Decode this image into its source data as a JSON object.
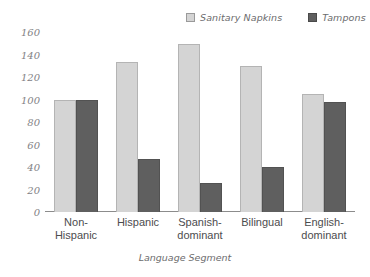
{
  "chart_data": {
    "type": "bar",
    "title": "",
    "subtitle": "",
    "xlabel": "Language Segment",
    "ylabel": "",
    "ylim": [
      0,
      160
    ],
    "yticks": [
      160,
      140,
      120,
      100,
      80,
      60,
      40,
      20,
      0
    ],
    "grid": false,
    "legend_position": "top-right",
    "categories": [
      "Non-Hispanic",
      "Hispanic",
      "Spanish-dominant",
      "Bilingual",
      "English-dominant"
    ],
    "category_lines": [
      [
        "Non-",
        "Hispanic"
      ],
      [
        "Hispanic",
        ""
      ],
      [
        "Spanish-",
        "dominant"
      ],
      [
        "Bilingual",
        ""
      ],
      [
        "English-",
        "dominant"
      ]
    ],
    "series": [
      {
        "name": "Sanitary Napkins",
        "color": "#d4d4d4",
        "values": [
          100,
          133,
          149,
          130,
          105
        ]
      },
      {
        "name": "Tampons",
        "color": "#5f5f5f",
        "values": [
          100,
          47,
          26,
          40,
          98
        ]
      }
    ]
  },
  "legend": {
    "entries": [
      {
        "label": "Sanitary Napkins"
      },
      {
        "label": "Tampons"
      }
    ]
  },
  "axis": {
    "x_title": "Language Segment"
  }
}
